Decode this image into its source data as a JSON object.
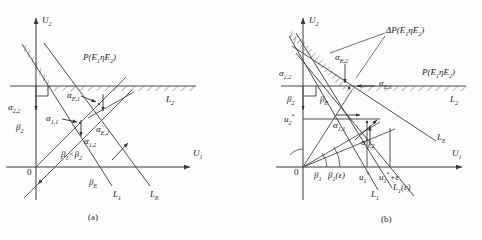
{
  "figure": {
    "caption_a": "(a)",
    "caption_b": "(b)",
    "width": 482,
    "height": 240,
    "line_color": "#4a4a4a",
    "text_color": "#1b1b1b"
  },
  "panel_a": {
    "axis_u2": "U",
    "axis_u2_sub": "2",
    "axis_u1": "U",
    "axis_u1_sub": "1",
    "origin": "0",
    "region_label": "P(E",
    "region_label_sub1": "1",
    "region_label_mid": "ηE",
    "region_label_sub2": "2",
    "region_label_end": ")",
    "alpha_22": "α",
    "alpha_22_sub": "2,2",
    "beta_2": "β",
    "beta_2_sub": "2",
    "alpha_E1": "α",
    "alpha_E1_sub": "E,1",
    "alpha_11": "α",
    "alpha_11_sub": "1,1",
    "alpha_E2": "α",
    "alpha_E2_sub": "E,2",
    "alpha_12": "α",
    "alpha_12_sub": "1,2",
    "beta_compare": "β",
    "beta_compare_sub1": "1",
    "beta_compare_op": "<β",
    "beta_compare_sub2": "2",
    "beta_E": "β",
    "beta_E_sub": "E",
    "L1": "L",
    "L1_sub": "1",
    "L2": "L",
    "L2_sub": "2",
    "LE": "L",
    "LE_sub": "E"
  },
  "panel_b": {
    "axis_u2": "U",
    "axis_u2_sub": "2",
    "axis_u1": "U",
    "axis_u1_sub": "1",
    "origin": "0",
    "delta_region": "ΔP(E",
    "delta_region_sub1": "1",
    "delta_region_mid": "ηE",
    "delta_region_sub2": "2",
    "delta_region_end": ")",
    "region_label": "P(E",
    "region_label_sub1": "1",
    "region_label_mid": "ηE",
    "region_label_sub2": "2",
    "region_label_end": ")",
    "alpha_22": "α",
    "alpha_22_sub": "2,2",
    "alpha_E2": "α",
    "alpha_E2_sub": "E,2",
    "alpha_E1": "α",
    "alpha_E1_sub": "E,1",
    "alpha_11": "α",
    "alpha_11_sub": "1,1",
    "alpha_12p": "α",
    "alpha_12p_prime": "′",
    "alpha_12p_sub": "1,2",
    "beta_2": "β",
    "beta_2_sub": "2",
    "beta_E": "β",
    "beta_E_sub": "E",
    "beta_1": "β",
    "beta_1_sub": "1",
    "beta_1_eps": "β",
    "beta_1_eps_sub": "1",
    "beta_1_eps_arg": "(ε)",
    "u2_star": "u",
    "u2_star_sub": "2",
    "u2_star_sup": "*",
    "u1_star": "u",
    "u1_star_sub": "1",
    "u1_star_sup": "*",
    "u1_star_eps": "u",
    "u1_star_eps_sub": "1",
    "u1_star_eps_sup": "*",
    "u1_star_eps_tail": "+ε",
    "L1": "L",
    "L1_sub": "1",
    "L1_eps": "L",
    "L1_eps_sub": "1",
    "L1_eps_arg": "(ε)",
    "L2": "L",
    "L2_sub": "2",
    "LE": "L",
    "LE_sub": "E"
  }
}
